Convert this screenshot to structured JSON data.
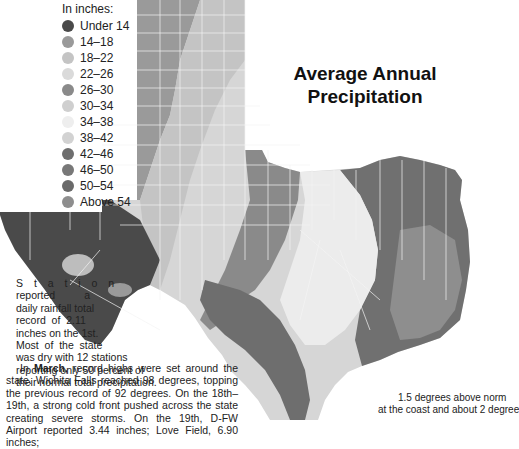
{
  "map": {
    "title_line1": "Average Annual",
    "title_line2": "Precipitation",
    "region": "Texas",
    "county_labels": [
      "Dallam",
      "Sherman",
      "Hansford",
      "Ochiltree",
      "Lipscomb",
      "Hartley",
      "Moore",
      "Hutchinson",
      "Roberts",
      "Hemphill",
      "Oldham",
      "Potter",
      "Carson",
      "Gray",
      "Wheeler",
      "Deaf Smith",
      "Randall",
      "Armstrong",
      "Donley",
      "Collingsworth",
      "Parmer",
      "Castro",
      "Swisher",
      "Briscoe",
      "Hall",
      "Childress",
      "Bailey",
      "Lamb",
      "Hale",
      "Floyd",
      "Motley",
      "Cottle",
      "Hardeman",
      "Foard",
      "Wilbarger",
      "Wichita",
      "Clay",
      "Montague",
      "Cooke",
      "Grayson",
      "Fannin",
      "Lamar",
      "Red River",
      "Bowie",
      "Cochran",
      "Hockley",
      "Lubbock",
      "Crosby",
      "Dickens",
      "King",
      "Knox",
      "Baylor",
      "Archer",
      "Yoakum",
      "Terry",
      "Lynn",
      "Garza",
      "Kent",
      "Stonewall",
      "Haskell",
      "Throckmorton",
      "Young",
      "Gaines",
      "Dawson",
      "Borden",
      "Scurry",
      "Fisher",
      "Jones",
      "Shackelford",
      "Stephens",
      "Andrews",
      "Martin",
      "Howard",
      "Mitchell",
      "Nolan",
      "Taylor",
      "Callahan",
      "Eastland",
      "El Paso",
      "Hudspeth",
      "Culberson",
      "Reeves",
      "Pecos",
      "Brewster",
      "Presidio",
      "Midland",
      "Glasscock",
      "Sterling",
      "Coke",
      "Runnels",
      "Coleman",
      "Brown",
      "Comanche",
      "Mills",
      "Hamilton",
      "Erath",
      "Hood",
      "Johnson",
      "Ellis",
      "Navarro",
      "Bosque",
      "Hill",
      "McLennan",
      "Limestone",
      "Freestone",
      "Leon",
      "Falls",
      "Robertson",
      "Bell",
      "Milam",
      "Williamson",
      "Travis",
      "Bastrop",
      "Lee",
      "Burleson",
      "Brazos",
      "Washington",
      "Austin",
      "Fayette",
      "Colorado",
      "Wharton",
      "Matagorda",
      "Lavaca",
      "DeWitt",
      "Goliad",
      "Victoria",
      "Refugio",
      "Calhoun",
      "Bee",
      "Live Oak",
      "McMullen",
      "Duval",
      "Jim Wells",
      "San Patricio",
      "Nueces",
      "Kleberg",
      "Galveston",
      "Jefferson",
      "Orange",
      "Hardin",
      "Chambers",
      "Harris",
      "Fort Bend",
      "Brazoria",
      "Montgomery",
      "Walker",
      "Grimes",
      "Madison",
      "Houston",
      "Anderson",
      "Henderson",
      "Kaufman",
      "Rockwall",
      "Dallas",
      "Tarrant",
      "Parker",
      "Palo Pinto",
      "Wise",
      "Jack",
      "Denton",
      "Collin",
      "Hunt",
      "Rains",
      "Hopkins",
      "Delta",
      "Franklin",
      "Titus",
      "Morris",
      "Cass",
      "Marion",
      "Harrison",
      "Panola",
      "Rusk",
      "Smith",
      "Gregg",
      "Upshur",
      "Wood",
      "Van Zandt",
      "Cherokee",
      "Nacogdoches",
      "Shelby",
      "San Augustine",
      "Sabine",
      "Angelina",
      "Trinity",
      "Polk",
      "Tyler",
      "Jasper",
      "Newton",
      "San Jacinto",
      "Liberty",
      "Schleicher",
      "Menard",
      "Kimble",
      "Kerr",
      "Sutton",
      "Edwards",
      "Real",
      "Bandera",
      "Kinney",
      "Uvalde",
      "Medina",
      "Maverick",
      "Zavala",
      "Frio",
      "Atascosa",
      "Dimmit",
      "La Salle",
      "Webb",
      "Bexar",
      "Comal",
      "Guadalupe",
      "Caldwell",
      "Hays",
      "Blanco",
      "Gillespie",
      "Kendall",
      "Llano",
      "Burnet",
      "San Saba",
      "Lampasas",
      "Coryell",
      "Mason",
      "McCulloch",
      "Concho",
      "Tom Green",
      "Irion",
      "Reagan",
      "Upton",
      "Crane",
      "Crockett",
      "Val Verde",
      "Terrell",
      "Ward",
      "Winkler",
      "Ector",
      "Loving",
      "Jeff Davis"
    ]
  },
  "legend": {
    "title": "In inches:",
    "items": [
      {
        "label": "Under 14",
        "color": "#4a4a4a"
      },
      {
        "label": "14–18",
        "color": "#9a9a9a"
      },
      {
        "label": "18–22",
        "color": "#c4c4c4"
      },
      {
        "label": "22–26",
        "color": "#dadada"
      },
      {
        "label": "26–30",
        "color": "#8a8a8a"
      },
      {
        "label": "30–34",
        "color": "#cfcfcf"
      },
      {
        "label": "34–38",
        "color": "#eeeeee"
      },
      {
        "label": "38–42",
        "color": "#d2d2d2"
      },
      {
        "label": "42–46",
        "color": "#6e6e6e"
      },
      {
        "label": "46–50",
        "color": "#787878"
      },
      {
        "label": "50–54",
        "color": "#6a6a6a"
      },
      {
        "label": "Above 54",
        "color": "#8e8e8e"
      }
    ]
  },
  "text": {
    "left_lines": [
      "S t a t i o n",
      "reported          a",
      "daily rainfall total",
      "record  of  2.11",
      "inches on the 1st.",
      "Most  of  the  state",
      "was dry with 12 stations",
      "reporting only 50 percent of",
      "their normal total precipitation."
    ],
    "march_intro": "In ",
    "march_bold": "March,",
    "march_rest": " record highs were set around the state. Wichita Falls reached 98 degrees, topping the previous record of 92 degrees. On the 18th–19th, a strong cold front pushed across the state creating severe storms. On the 19th, D-FW Airport reported 3.44 inches; Love Field, 6.90 inches;",
    "right_line1": "1.5 degrees above norm",
    "right_line2": "at the coast and about 2 degree"
  }
}
